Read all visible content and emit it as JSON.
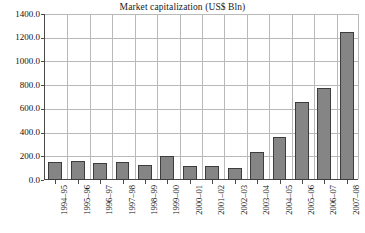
{
  "chart_data": {
    "type": "bar",
    "title": "Market capitalization (US$ Bln)",
    "xlabel": "",
    "ylabel": "",
    "ylim": [
      0,
      1400
    ],
    "ytick_step": 200,
    "grid": true,
    "legend": "none",
    "categories": [
      "1994–95",
      "1995–96",
      "1996–97",
      "1997–98",
      "1998–99",
      "1999–00",
      "2000–01",
      "2001–02",
      "2002–03",
      "2003–04",
      "2004–05",
      "2005–06",
      "2006–07",
      "2007–08"
    ],
    "values": [
      155,
      160,
      140,
      150,
      130,
      200,
      115,
      120,
      105,
      240,
      365,
      660,
      780,
      1250
    ],
    "ytick_labels": [
      "0.0",
      "200.0",
      "400.0",
      "600.0",
      "800.0",
      "1000.0",
      "1200.0",
      "1400.0"
    ],
    "ytick_values": [
      0,
      200,
      400,
      600,
      800,
      1000,
      1200,
      1400
    ],
    "colors": {
      "bar_fill": "#858585",
      "bar_border": "#3d3d3d",
      "gridline": "#b9b9b9",
      "axis": "#4a4a4a",
      "background": "#ffffff",
      "text": "#111111"
    }
  }
}
